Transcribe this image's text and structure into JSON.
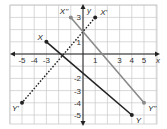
{
  "chart_data": {
    "type": "scatter",
    "title": "",
    "xlabel": "x",
    "ylabel": "y",
    "xlim": [
      -6,
      6
    ],
    "ylim": [
      -5.8,
      4
    ],
    "grid": true,
    "x_tick_labels": [
      "-5",
      "-4",
      "-3",
      "1",
      "3",
      "4",
      "5"
    ],
    "x_tick_values": [
      -5,
      -4,
      -3,
      1,
      3,
      4,
      5
    ],
    "y_tick_labels": [
      "3",
      "1",
      "-2",
      "-3",
      "-4",
      "-5"
    ],
    "y_tick_values": [
      3,
      1,
      -2,
      -3,
      -4,
      -5
    ],
    "segments": [
      {
        "name": "XY",
        "from": {
          "label": "X",
          "x": -3,
          "y": 1
        },
        "to": {
          "label": "Y",
          "x": 4,
          "y": -5
        },
        "style": "solid",
        "color": "#222222"
      },
      {
        "name": "X'Y'",
        "from": {
          "label": "X'",
          "x": 1,
          "y": 3
        },
        "to": {
          "label": "Y'",
          "x": -5,
          "y": -4
        },
        "style": "dotted",
        "color": "#222222"
      },
      {
        "name": "X''Y''",
        "from": {
          "label": "X''",
          "x": -1,
          "y": 3
        },
        "to": {
          "label": "Y''",
          "x": 5,
          "y": -4
        },
        "style": "solid",
        "color": "#8a8a8a"
      }
    ]
  },
  "colors": {
    "grid": "#c8c8c8",
    "axis": "#222222",
    "background": "#ffffff"
  }
}
